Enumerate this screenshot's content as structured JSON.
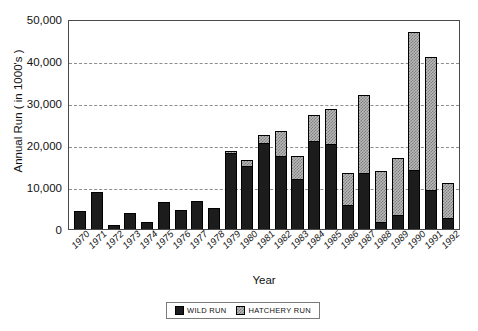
{
  "chart_data": {
    "type": "bar",
    "stacked": true,
    "title": "",
    "xlabel": "Year",
    "ylabel": "Annual Run ( in 1000's )",
    "ylim": [
      0,
      50000
    ],
    "yticks": [
      0,
      10000,
      20000,
      30000,
      40000,
      50000
    ],
    "ytick_labels": [
      "0",
      "10,000",
      "20,000",
      "30,000",
      "40,000",
      "50,000"
    ],
    "grid": true,
    "grid_axis": "y",
    "legend_position": "bottom-center",
    "categories": [
      "1970",
      "1971",
      "1972",
      "1973",
      "1974",
      "1975",
      "1976",
      "1977",
      "1978",
      "1979",
      "1980",
      "1981",
      "1982",
      "1983",
      "1984",
      "1985",
      "1986",
      "1987",
      "1988",
      "1989",
      "1990",
      "1991",
      "1992"
    ],
    "series": [
      {
        "name": "WILD RUN",
        "color": "#1c1c1c",
        "values": [
          4200,
          8900,
          900,
          3900,
          1600,
          6400,
          4600,
          6700,
          5100,
          18000,
          15000,
          20500,
          17500,
          12000,
          21000,
          20200,
          5600,
          13300,
          1600,
          3300,
          14000,
          9300,
          2600
        ]
      },
      {
        "name": "HATCHERY RUN",
        "color": "#b9b9b9",
        "values": [
          0,
          0,
          0,
          0,
          0,
          0,
          0,
          0,
          0,
          600,
          1400,
          2000,
          5900,
          5300,
          6200,
          8300,
          7800,
          18700,
          12300,
          13700,
          33000,
          31700,
          8400
        ]
      }
    ],
    "totals": [
      4200,
      8900,
      900,
      3900,
      1600,
      6400,
      4600,
      6700,
      5100,
      18600,
      16400,
      22500,
      23400,
      17300,
      27200,
      28500,
      13400,
      32000,
      13900,
      17000,
      47000,
      41000,
      11000
    ]
  },
  "legend": {
    "items": [
      {
        "label": "WILD RUN",
        "swatch": "solid-black"
      },
      {
        "label": "HATCHERY RUN",
        "swatch": "checkered-gray"
      }
    ]
  }
}
